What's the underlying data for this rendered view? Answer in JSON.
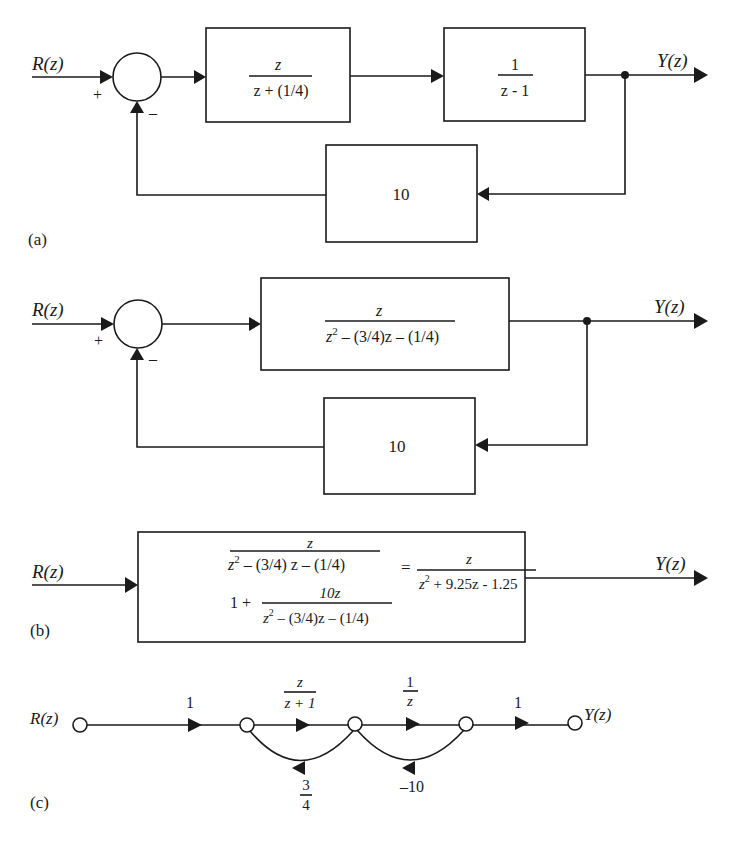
{
  "part_a": {
    "label": "(a)",
    "input": "R(z)",
    "output": "Y(z)",
    "sum_plus": "+",
    "sum_minus": "–",
    "block1": {
      "num": "z",
      "den": "z + (1/4)"
    },
    "block2": {
      "num": "1",
      "den": "z - 1"
    },
    "feedback": {
      "gain": "10"
    }
  },
  "part_b1": {
    "input": "R(z)",
    "output": "Y(z)",
    "sum_plus": "+",
    "sum_minus": "–",
    "block": {
      "num": "z",
      "den_main": "z",
      "den_sup": "2",
      "den_rest": " – (3/4)z – (1/4)"
    },
    "feedback": {
      "gain": "10"
    }
  },
  "part_b2": {
    "label": "(b)",
    "input": "R(z)",
    "output": "Y(z)",
    "lhs_num": "z",
    "lhs_num_den_main": "z",
    "lhs_num_den_sup": "2",
    "lhs_num_den_rest": " – (3/4) z  – (1/4)",
    "lhs_den_one": "1 +",
    "lhs_den_frac_num": "10z",
    "lhs_den_frac_den_main": "z",
    "lhs_den_frac_den_sup": "2",
    "lhs_den_frac_den_rest": " – (3/4)z – (1/4)",
    "equals": "=",
    "rhs_num": "z",
    "rhs_den_main": "z",
    "rhs_den_sup": "2",
    "rhs_den_rest": " + 9.25z - 1.25"
  },
  "part_c": {
    "label": "(c)",
    "input": "R(z)",
    "output": "Y(z)",
    "gains": {
      "g1": "1",
      "g2_num": "z",
      "g2_den": "z + 1",
      "g3_num": "1",
      "g3_den": "z",
      "g4": "1",
      "fb1_num": "3",
      "fb1_den": "4",
      "fb2": "–10"
    }
  }
}
